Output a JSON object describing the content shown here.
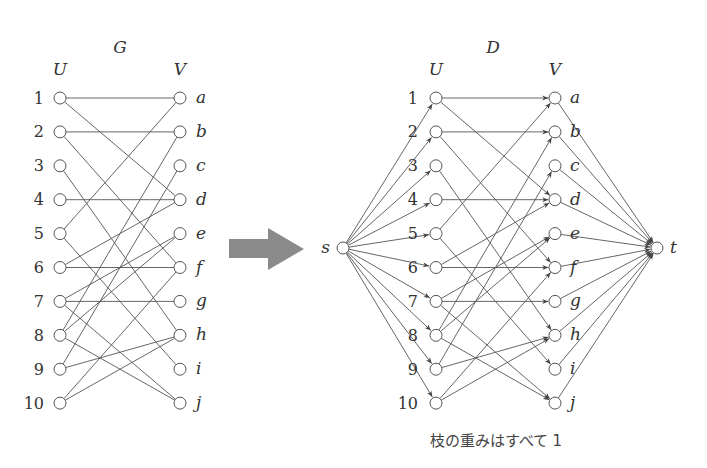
{
  "graph_g": {
    "title": "G",
    "left_set_label": "U",
    "right_set_label": "V",
    "left_nodes": [
      "1",
      "2",
      "3",
      "4",
      "5",
      "6",
      "7",
      "8",
      "9",
      "10"
    ],
    "right_nodes": [
      "a",
      "b",
      "c",
      "d",
      "e",
      "f",
      "g",
      "h",
      "i",
      "j"
    ],
    "edges": [
      [
        "1",
        "a"
      ],
      [
        "1",
        "d"
      ],
      [
        "2",
        "b"
      ],
      [
        "2",
        "f"
      ],
      [
        "3",
        "h"
      ],
      [
        "4",
        "d"
      ],
      [
        "5",
        "a"
      ],
      [
        "5",
        "i"
      ],
      [
        "6",
        "d"
      ],
      [
        "6",
        "f"
      ],
      [
        "7",
        "e"
      ],
      [
        "7",
        "g"
      ],
      [
        "7",
        "j"
      ],
      [
        "8",
        "b"
      ],
      [
        "8",
        "e"
      ],
      [
        "8",
        "j"
      ],
      [
        "9",
        "c"
      ],
      [
        "9",
        "h"
      ],
      [
        "10",
        "f"
      ],
      [
        "10",
        "h"
      ]
    ]
  },
  "transform_arrow": {
    "color": "#8a8a8a"
  },
  "graph_d": {
    "title": "D",
    "left_set_label": "U",
    "right_set_label": "V",
    "source_label": "s",
    "sink_label": "t",
    "caption": "枝の重みはすべて 1",
    "directed": true,
    "edge_weight": 1
  }
}
